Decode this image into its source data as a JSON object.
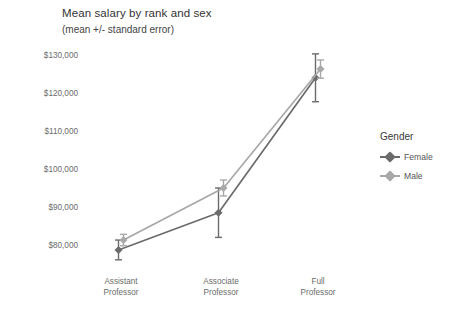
{
  "chart_data": {
    "type": "line",
    "title": "Mean salary by rank and sex",
    "subtitle": "(mean +/- standard error)",
    "xlabel": "",
    "ylabel": "",
    "categories": [
      "Assistant\nProfessor",
      "Associate\nProfessor",
      "Full\nProfessor"
    ],
    "category_lines": [
      [
        "Assistant",
        "Professor"
      ],
      [
        "Associate",
        "Professor"
      ],
      [
        "Full",
        "Professor"
      ]
    ],
    "ylim": [
      75000,
      132000
    ],
    "yticks": [
      80000,
      90000,
      100000,
      110000,
      120000,
      130000
    ],
    "ytick_labels": [
      "$80,000",
      "$90,000",
      "$100,000",
      "$110,000",
      "$120,000",
      "$130,000"
    ],
    "grid": false,
    "legend_position": "right",
    "legend_title": "Gender",
    "series": [
      {
        "name": "Female",
        "color": "#6b6b6b",
        "values": [
          78700,
          88500,
          124000
        ],
        "errors": [
          2600,
          6500,
          6300
        ]
      },
      {
        "name": "Male",
        "color": "#a8a8a8",
        "values": [
          81300,
          95000,
          126300
        ],
        "errors": [
          1500,
          2100,
          2400
        ]
      }
    ]
  },
  "legend": {
    "title": "Gender",
    "items": [
      {
        "label": "Female",
        "color": "#6b6b6b"
      },
      {
        "label": "Male",
        "color": "#a8a8a8"
      }
    ]
  },
  "colors": {
    "background": "#ffffff",
    "text": "#3c3c3c",
    "tick_text": "#6b6b6b",
    "female": "#6b6b6b",
    "male": "#a8a8a8"
  }
}
